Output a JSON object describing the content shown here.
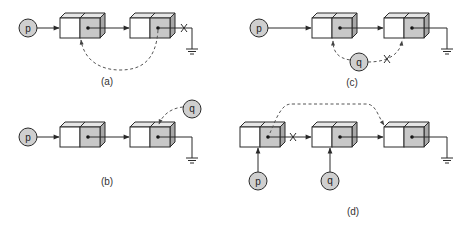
{
  "diagram": {
    "colors": {
      "stroke": "#2a2a2a",
      "node_white": "#ffffff",
      "node_gray": "#c8c8c8",
      "node_side": "#a8a8a8",
      "node_top": "#e6e6e6",
      "pointer_fill": "#cfcfcf",
      "dash": "#555555"
    },
    "panels": [
      {
        "id": "a",
        "label": "(a)",
        "pointers": [
          {
            "name": "p",
            "label": "p"
          }
        ],
        "nodes": 2,
        "notes": "p points to node1; node1 next -> node2; node2 next link to null crossed out (X); dashed arc from node2 pointer back to node1 (cycle)"
      },
      {
        "id": "b",
        "label": "(b)",
        "pointers": [
          {
            "name": "p",
            "label": "p"
          },
          {
            "name": "q",
            "label": "q"
          }
        ],
        "nodes": 2,
        "notes": "p points to node1; node1 -> node2 -> null; q dashed pointer to node2"
      },
      {
        "id": "c",
        "label": "(c)",
        "pointers": [
          {
            "name": "p",
            "label": "p"
          },
          {
            "name": "q",
            "label": "q"
          }
        ],
        "nodes": 2,
        "notes": "p points to node1; node1 -> node2 -> null; q dashed link to node1 and crossed-out (X) dashed link to node2"
      },
      {
        "id": "d",
        "label": "(d)",
        "pointers": [
          {
            "name": "p",
            "label": "p"
          },
          {
            "name": "q",
            "label": "q"
          }
        ],
        "nodes": 3,
        "notes": "p points to node1, q points to node2; node1 -> node2 crossed out (X); dashed link from node1 to node3; node2 -> node3 -> null"
      }
    ]
  }
}
